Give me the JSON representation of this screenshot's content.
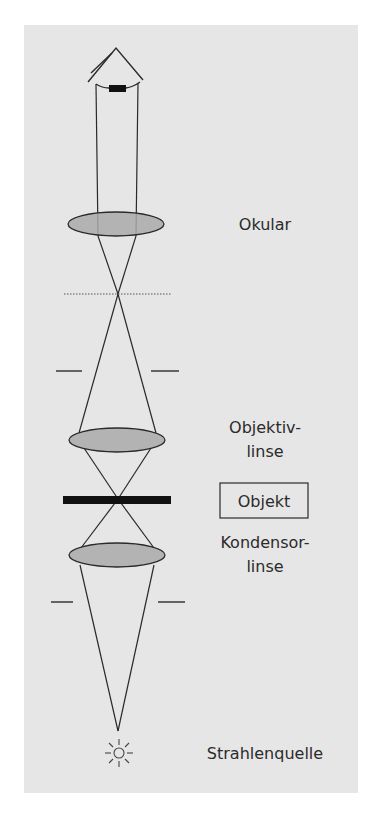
{
  "labels": {
    "ocular": "Okular",
    "objective_line1": "Objektiv-",
    "objective_line2": "linse",
    "object": "Objekt",
    "condenser_line1": "Kondensor-",
    "condenser_line2": "linse",
    "light_source": "Strahlenquelle"
  },
  "colors": {
    "panel": "#e6e6e6",
    "lens_fill": "#a9a9a9",
    "stroke": "#2a2a2a",
    "object_bar": "#111111",
    "text": "#2b2b2b"
  },
  "icons": {
    "eye": "eye-icon",
    "light_source": "sun-icon"
  }
}
